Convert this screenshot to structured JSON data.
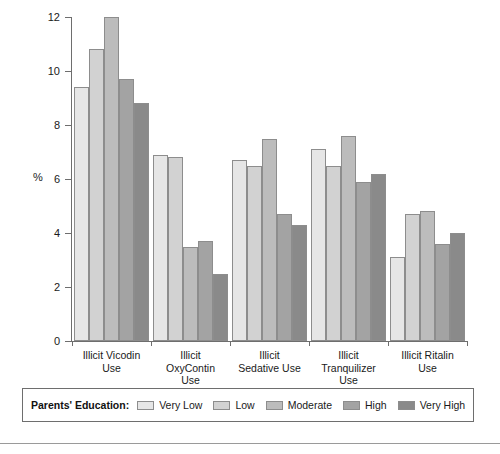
{
  "chart_data": {
    "type": "bar",
    "title": "",
    "xlabel": "",
    "ylabel": "%",
    "ylim": [
      0,
      12
    ],
    "yticks": [
      0,
      2,
      4,
      6,
      8,
      10,
      12
    ],
    "ytick_labels": [
      "0",
      "2",
      "4",
      "6",
      "8",
      "10",
      "12"
    ],
    "grid": false,
    "legend_position": "bottom",
    "legend_title": "Parents' Education:",
    "categories": [
      "Illicit Vicodin Use",
      "Illicit OxyContin Use",
      "Illicit Sedative Use",
      "Illicit Tranquilizer Use",
      "Illicit Ritalin Use"
    ],
    "category_lines": [
      [
        "Illicit Vicodin",
        "Use"
      ],
      [
        "Illicit",
        "OxyContin",
        "Use"
      ],
      [
        "Illicit",
        "Sedative Use"
      ],
      [
        "Illicit",
        "Tranquilizer",
        "Use"
      ],
      [
        "Illicit Ritalin",
        "Use"
      ]
    ],
    "series": [
      {
        "name": "Very Low",
        "color": "#e6e6e6",
        "values": [
          9.4,
          6.9,
          6.7,
          7.1,
          3.1
        ]
      },
      {
        "name": "Low",
        "color": "#d2d2d2",
        "values": [
          10.8,
          6.8,
          6.5,
          6.5,
          4.7
        ]
      },
      {
        "name": "Moderate",
        "color": "#bcbcbc",
        "values": [
          12.0,
          3.5,
          7.5,
          7.6,
          4.8
        ]
      },
      {
        "name": "High",
        "color": "#a3a3a3",
        "values": [
          9.7,
          3.7,
          4.7,
          5.9,
          3.6
        ]
      },
      {
        "name": "Very High",
        "color": "#8a8a8a",
        "values": [
          8.8,
          2.5,
          4.3,
          6.2,
          4.0
        ]
      }
    ]
  }
}
